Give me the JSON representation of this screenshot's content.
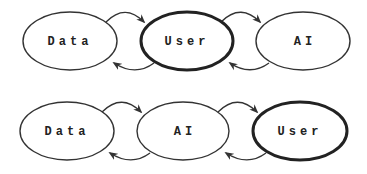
{
  "diagram": {
    "rows": [
      {
        "name": "row-1",
        "nodes": [
          {
            "label": "Data",
            "emphasized": false
          },
          {
            "label": "User",
            "emphasized": true
          },
          {
            "label": "AI",
            "emphasized": false
          }
        ],
        "connections": [
          {
            "from": "Data",
            "to": "User",
            "direction": "forward"
          },
          {
            "from": "User",
            "to": "Data",
            "direction": "back"
          },
          {
            "from": "User",
            "to": "AI",
            "direction": "forward"
          },
          {
            "from": "AI",
            "to": "User",
            "direction": "back"
          }
        ]
      },
      {
        "name": "row-2",
        "nodes": [
          {
            "label": "Data",
            "emphasized": false
          },
          {
            "label": "AI",
            "emphasized": false
          },
          {
            "label": "User",
            "emphasized": true
          }
        ],
        "connections": [
          {
            "from": "Data",
            "to": "AI",
            "direction": "forward"
          },
          {
            "from": "AI",
            "to": "Data",
            "direction": "back"
          },
          {
            "from": "AI",
            "to": "User",
            "direction": "forward"
          },
          {
            "from": "User",
            "to": "AI",
            "direction": "back"
          }
        ]
      }
    ],
    "colors": {
      "stroke": "#333333",
      "background": "#ffffff",
      "text": "#222222"
    }
  }
}
